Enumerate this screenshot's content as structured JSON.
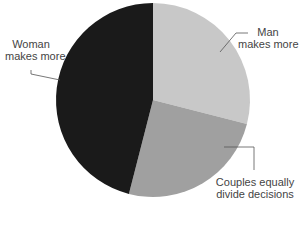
{
  "chart_data": {
    "type": "pie",
    "title": "",
    "categories": [
      "Man makes more",
      "Couples equally divide decisions",
      "Woman makes more"
    ],
    "values": [
      29,
      25,
      46
    ],
    "colors": [
      "#c8c8c8",
      "#a0a0a0",
      "#1a1a1a"
    ],
    "start_angle": "12 o'clock, clockwise"
  },
  "labels": {
    "man": [
      "Man",
      "makes more"
    ],
    "couples": [
      "Couples equally",
      "divide decisions"
    ],
    "woman": [
      "Woman",
      "makes more"
    ]
  }
}
